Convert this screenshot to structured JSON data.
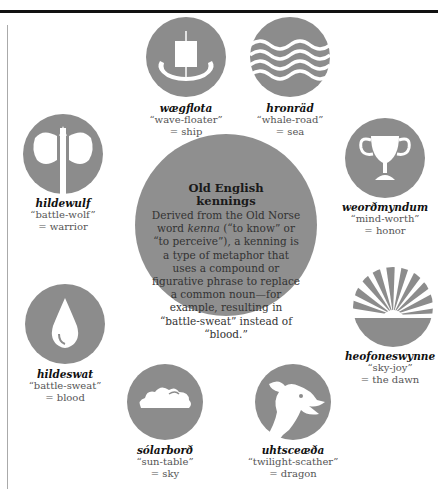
{
  "colors": {
    "circle": "#8c8c8c",
    "rule": "#111111",
    "text": "#555555",
    "term": "#111111"
  },
  "center": {
    "title_line1": "Old English",
    "title_line2": "kennings",
    "body_pre": "Derived from the Old Norse word ",
    "body_italic": "kenna",
    "body_post": " (“to know” or “to perceive”), a kenning is a type of metaphor that uses a compound or figurative phrase to replace a common noun—for example, resulting in “battle-sweat” instead of “blood.”"
  },
  "kennings": [
    {
      "term": "wægflota",
      "literal": "“wave-floater”",
      "meaning": "= ship",
      "icon": "viking-ship-icon"
    },
    {
      "term": "hronräd",
      "literal": "“whale-road”",
      "meaning": "= sea",
      "icon": "waves-icon"
    },
    {
      "term": "hildewulf",
      "literal": "“battle-wolf”",
      "meaning": "= warrior",
      "icon": "battle-axe-icon"
    },
    {
      "term": "weorðmyndum",
      "literal": "“mind-worth”",
      "meaning": "= honor",
      "icon": "trophy-cup-icon"
    },
    {
      "term": "hildeswat",
      "literal": "“battle-sweat”",
      "meaning": "= blood",
      "icon": "blood-drop-icon"
    },
    {
      "term": "heofoneswynne",
      "literal": "“sky-joy”",
      "meaning": "= the dawn",
      "icon": "sunrise-icon"
    },
    {
      "term": "sólarborð",
      "literal": "“sun-table”",
      "meaning": "= sky",
      "icon": "cloud-icon"
    },
    {
      "term": "uhtsceæða",
      "literal": "“twilight-scather”",
      "meaning": "= dragon",
      "icon": "dragon-head-icon"
    }
  ]
}
